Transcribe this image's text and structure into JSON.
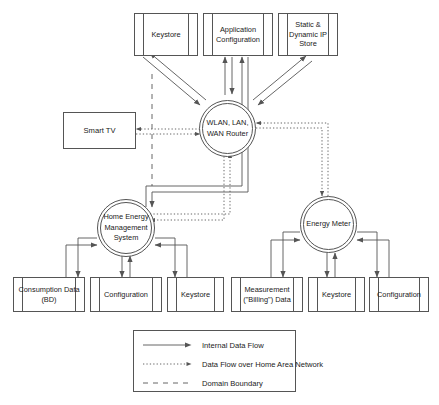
{
  "diagram": {
    "type": "data-flow-diagram",
    "background_color": "#ffffff",
    "line_color": "#555555",
    "text_color": "#1a1a1a"
  },
  "nodes": {
    "keystore_top": {
      "label": "Keystore",
      "shape": "data-store"
    },
    "application_configuration": {
      "label": "Application Configuration",
      "shape": "data-store"
    },
    "static_dynamic_ip_store": {
      "label": "Static & Dynamic IP Store",
      "shape": "data-store"
    },
    "router": {
      "label": "WLAN, LAN, WAN Router",
      "shape": "process-circle"
    },
    "smart_tv": {
      "label": "Smart TV",
      "shape": "external-entity"
    },
    "hems": {
      "label": "Home Energy Management System",
      "shape": "process-circle"
    },
    "energy_meter": {
      "label": "Energy Meter",
      "shape": "process-circle"
    },
    "consumption_data": {
      "label": "Consumption Data (BD)",
      "shape": "data-store"
    },
    "configuration_left": {
      "label": "Configuration",
      "shape": "data-store"
    },
    "keystore_left": {
      "label": "Keystore",
      "shape": "data-store"
    },
    "measurement_billing_data": {
      "label": "Measurement (\"Billing\") Data",
      "shape": "data-store"
    },
    "keystore_right": {
      "label": "Keystore",
      "shape": "data-store"
    },
    "configuration_right": {
      "label": "Configuration",
      "shape": "data-store"
    }
  },
  "legend": {
    "items": [
      {
        "label": "Internal Data Flow",
        "style": "solid-arrow"
      },
      {
        "label": "Data Flow over Home Area Network",
        "style": "dotted-arrow"
      },
      {
        "label": "Domain Boundary",
        "style": "dashed-line"
      }
    ]
  },
  "edges": [
    {
      "from": "router",
      "to": "keystore_top",
      "style": "solid",
      "direction": "bidirectional"
    },
    {
      "from": "router",
      "to": "application_configuration",
      "style": "solid",
      "direction": "bidirectional"
    },
    {
      "from": "router",
      "to": "static_dynamic_ip_store",
      "style": "solid",
      "direction": "bidirectional"
    },
    {
      "from": "router",
      "to": "smart_tv",
      "style": "dotted",
      "direction": "bidirectional"
    },
    {
      "from": "router",
      "to": "hems",
      "style": "dotted",
      "direction": "bidirectional"
    },
    {
      "from": "router",
      "to": "energy_meter",
      "style": "dotted",
      "direction": "bidirectional"
    },
    {
      "from": "hems",
      "to": "consumption_data",
      "style": "solid",
      "direction": "bidirectional"
    },
    {
      "from": "hems",
      "to": "configuration_left",
      "style": "solid",
      "direction": "bidirectional"
    },
    {
      "from": "hems",
      "to": "keystore_left",
      "style": "solid",
      "direction": "bidirectional"
    },
    {
      "from": "hems",
      "to": "application_configuration",
      "style": "solid",
      "direction": "bidirectional"
    },
    {
      "from": "energy_meter",
      "to": "measurement_billing_data",
      "style": "solid",
      "direction": "bidirectional"
    },
    {
      "from": "energy_meter",
      "to": "keystore_right",
      "style": "solid",
      "direction": "bidirectional"
    },
    {
      "from": "energy_meter",
      "to": "configuration_right",
      "style": "solid",
      "direction": "bidirectional"
    }
  ]
}
